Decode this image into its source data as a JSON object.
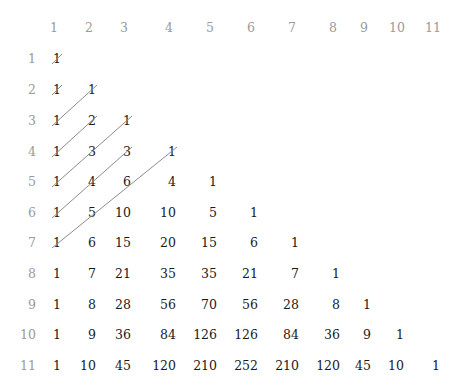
{
  "column_headers": [
    "1",
    "2",
    "3",
    "4",
    "5",
    "6",
    "7",
    "8",
    "9",
    "10",
    "11"
  ],
  "row_labels": [
    "1",
    "2",
    "3",
    "4",
    "5",
    "6",
    "7",
    "8",
    "9",
    "10",
    "11"
  ],
  "rows": [
    [
      "1"
    ],
    [
      "1",
      "1"
    ],
    [
      "1",
      "2",
      "1"
    ],
    [
      "1",
      "3",
      "3",
      "1"
    ],
    [
      "1",
      "4",
      "6",
      "4",
      "1"
    ],
    [
      "1",
      "5",
      "10",
      "10",
      "5",
      "1"
    ],
    [
      "1",
      "6",
      "15",
      "20",
      "15",
      "6",
      "1"
    ],
    [
      "1",
      "7",
      "21",
      "35",
      "35",
      "21",
      "7",
      "1"
    ],
    [
      "1",
      "8",
      "28",
      "56",
      "70",
      "56",
      "28",
      "8",
      "1"
    ],
    [
      "1",
      "9",
      "36",
      "84",
      "126",
      "126",
      "84",
      "36",
      "9",
      "1"
    ],
    [
      "1",
      "10",
      "45",
      "120",
      "210",
      "252",
      "210",
      "120",
      "45",
      "10",
      "1"
    ]
  ],
  "diagonals": [
    {
      "from": [
        1,
        1
      ],
      "to": [
        1,
        1
      ]
    },
    {
      "from": [
        2,
        1
      ],
      "to": [
        2,
        1
      ]
    },
    {
      "from": [
        3,
        1
      ],
      "to": [
        2,
        2
      ]
    },
    {
      "from": [
        4,
        1
      ],
      "to": [
        3,
        2
      ]
    },
    {
      "from": [
        5,
        1
      ],
      "to": [
        3,
        3
      ]
    },
    {
      "from": [
        6,
        1
      ],
      "to": [
        4,
        3
      ]
    },
    {
      "from": [
        7,
        1
      ],
      "to": [
        4,
        4
      ]
    }
  ],
  "colors": {
    "header": "#9a9a9a",
    "value": "#1a1a1a",
    "diagonal": "#8c8c8c"
  }
}
